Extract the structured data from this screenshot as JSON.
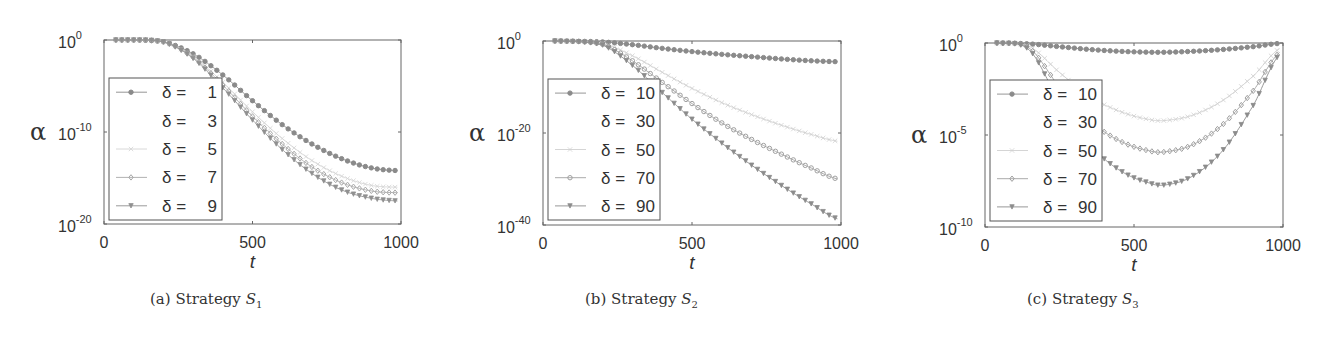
{
  "chart_data": [
    {
      "type": "line",
      "panel_label": "(a)",
      "caption_text": "Strategy",
      "caption_symbol": "S",
      "caption_subscript": "1",
      "xlabel": "t",
      "ylabel": "α",
      "yscale": "log",
      "xlim": [
        0,
        1000
      ],
      "ylim_exponents": [
        -20,
        0
      ],
      "xticks": [
        0,
        500,
        1000
      ],
      "yticks": [
        {
          "base": "10",
          "exp": "0",
          "value": 0
        },
        {
          "base": "10",
          "exp": "-10",
          "value": -10
        },
        {
          "base": "10",
          "exp": "-20",
          "value": -20
        }
      ],
      "legend_position": "center-left",
      "x": [
        40,
        200,
        300,
        400,
        500,
        600,
        700,
        800,
        900,
        990
      ],
      "series": [
        {
          "name": "δ =   1",
          "label_prefix": "δ =",
          "label_value": "1",
          "marker": "dot",
          "color": "#8a8a8a",
          "log10_values": [
            0,
            -0.2,
            -1.5,
            -3.8,
            -6.6,
            -9.2,
            -11.3,
            -12.9,
            -13.9,
            -14.2
          ]
        },
        {
          "name": "δ =   3",
          "label_prefix": "δ =",
          "label_value": "3",
          "marker": "none",
          "color": "#ffffff",
          "log10_values": [
            0,
            -0.2,
            -1.7,
            -4.3,
            -7.4,
            -10.2,
            -12.5,
            -14.2,
            -15.3,
            -15.7
          ]
        },
        {
          "name": "δ =   5",
          "label_prefix": "δ =",
          "label_value": "5",
          "marker": "x",
          "color": "#d4d4d4",
          "log10_values": [
            0,
            -0.2,
            -1.8,
            -4.6,
            -7.8,
            -10.7,
            -13.1,
            -14.8,
            -15.8,
            -16.0
          ]
        },
        {
          "name": "δ =   7",
          "label_prefix": "δ =",
          "label_value": "7",
          "marker": "diamond",
          "color": "#a8a8a8",
          "log10_values": [
            0,
            -0.2,
            -1.9,
            -4.9,
            -8.3,
            -11.3,
            -13.8,
            -15.5,
            -16.4,
            -16.6
          ]
        },
        {
          "name": "δ =   9",
          "label_prefix": "δ =",
          "label_value": "9",
          "marker": "triangle",
          "color": "#909090",
          "log10_values": [
            0,
            -0.2,
            -2.0,
            -5.2,
            -8.7,
            -11.9,
            -14.5,
            -16.3,
            -17.2,
            -17.5
          ]
        }
      ]
    },
    {
      "type": "line",
      "panel_label": "(b)",
      "caption_text": "Strategy",
      "caption_symbol": "S",
      "caption_subscript": "2",
      "xlabel": "t",
      "ylabel": "α",
      "yscale": "log",
      "xlim": [
        0,
        1000
      ],
      "ylim_exponents": [
        -40,
        0
      ],
      "xticks": [
        0,
        500,
        1000
      ],
      "yticks": [
        {
          "base": "10",
          "exp": "0",
          "value": 0
        },
        {
          "base": "10",
          "exp": "-20",
          "value": -20
        },
        {
          "base": "10",
          "exp": "-40",
          "value": -40
        }
      ],
      "legend_position": "center-left",
      "x": [
        40,
        200,
        300,
        400,
        500,
        600,
        700,
        800,
        900,
        990
      ],
      "series": [
        {
          "name": "δ = 10",
          "label_prefix": "δ =",
          "label_value": "10",
          "marker": "dot",
          "color": "#8a8a8a",
          "log10_values": [
            0,
            -0.2,
            -0.8,
            -1.6,
            -2.3,
            -2.9,
            -3.4,
            -3.9,
            -4.3,
            -4.5
          ]
        },
        {
          "name": "δ = 30",
          "label_prefix": "δ =",
          "label_value": "30",
          "marker": "none",
          "color": "#ffffff",
          "log10_values": [
            0,
            -0.3,
            -2.0,
            -4.5,
            -7.0,
            -9.2,
            -11.0,
            -12.5,
            -13.6,
            -14.3
          ]
        },
        {
          "name": "δ = 50",
          "label_prefix": "δ =",
          "label_value": "50",
          "marker": "x",
          "color": "#d0d0d0",
          "log10_values": [
            0,
            -0.5,
            -3.2,
            -6.8,
            -10.3,
            -13.4,
            -16.0,
            -18.3,
            -20.3,
            -21.8
          ]
        },
        {
          "name": "δ = 70",
          "label_prefix": "δ =",
          "label_value": "70",
          "marker": "circle",
          "color": "#a0a0a0",
          "log10_values": [
            0,
            -0.7,
            -4.3,
            -9.0,
            -13.6,
            -17.8,
            -21.4,
            -24.6,
            -27.6,
            -30.0
          ]
        },
        {
          "name": "δ = 90",
          "label_prefix": "δ =",
          "label_value": "90",
          "marker": "triangle",
          "color": "#8c8c8c",
          "log10_values": [
            0,
            -0.9,
            -5.3,
            -11.2,
            -17.0,
            -22.2,
            -27.0,
            -31.4,
            -35.4,
            -38.7
          ]
        }
      ]
    },
    {
      "type": "line",
      "panel_label": "(c)",
      "caption_text": "Strategy",
      "caption_symbol": "S",
      "caption_subscript": "3",
      "xlabel": "t",
      "ylabel": "α",
      "yscale": "log",
      "xlim": [
        0,
        1000
      ],
      "ylim_exponents": [
        -10,
        0
      ],
      "xticks": [
        0,
        500,
        1000
      ],
      "yticks": [
        {
          "base": "10",
          "exp": "0",
          "value": 0
        },
        {
          "base": "10",
          "exp": "-5",
          "value": -5
        },
        {
          "base": "10",
          "exp": "-10",
          "value": -10
        }
      ],
      "legend_position": "center-left",
      "x": [
        40,
        150,
        250,
        350,
        450,
        550,
        610,
        700,
        800,
        900,
        990
      ],
      "series": [
        {
          "name": "δ = 10",
          "label_prefix": "δ =",
          "label_value": "10",
          "marker": "dot",
          "color": "#8a8a8a",
          "log10_values": [
            0,
            -0.05,
            -0.2,
            -0.35,
            -0.45,
            -0.5,
            -0.5,
            -0.45,
            -0.35,
            -0.2,
            -0.02
          ]
        },
        {
          "name": "δ = 30",
          "label_prefix": "δ =",
          "label_value": "30",
          "marker": "none",
          "color": "#ffffff",
          "log10_values": [
            0,
            -0.1,
            -0.9,
            -1.7,
            -2.2,
            -2.5,
            -2.5,
            -2.3,
            -1.8,
            -1.0,
            -0.1
          ]
        },
        {
          "name": "δ = 50",
          "label_prefix": "δ =",
          "label_value": "50",
          "marker": "x",
          "color": "#d0d0d0",
          "log10_values": [
            0,
            -0.2,
            -1.6,
            -2.9,
            -3.7,
            -4.15,
            -4.2,
            -3.9,
            -3.1,
            -1.8,
            -0.3
          ]
        },
        {
          "name": "δ = 70",
          "label_prefix": "δ =",
          "label_value": "70",
          "marker": "diamond",
          "color": "#a0a0a0",
          "log10_values": [
            0,
            -0.3,
            -2.4,
            -4.2,
            -5.3,
            -5.85,
            -5.9,
            -5.5,
            -4.4,
            -2.6,
            -0.5
          ]
        },
        {
          "name": "δ = 90",
          "label_prefix": "δ =",
          "label_value": "90",
          "marker": "triangle",
          "color": "#8c8c8c",
          "log10_values": [
            0,
            -0.4,
            -3.2,
            -5.5,
            -6.9,
            -7.6,
            -7.7,
            -7.2,
            -5.8,
            -3.4,
            -0.6
          ]
        }
      ]
    }
  ],
  "layout": {
    "panels": [
      {
        "offset_x": 0,
        "plot": {
          "x0": 104,
          "y0": 40,
          "x1": 401,
          "y1": 224
        },
        "legend": {
          "x0": 109,
          "y0": 78,
          "x1": 222,
          "y1": 220
        },
        "caption_x": 150
      },
      {
        "offset_x": 440,
        "plot": {
          "x0": 543,
          "y0": 41,
          "x1": 841,
          "y1": 225
        },
        "legend": {
          "x0": 548,
          "y0": 79,
          "x1": 660,
          "y1": 220
        },
        "caption_x": 585
      },
      {
        "offset_x": 880,
        "plot": {
          "x0": 985,
          "y0": 43,
          "x1": 1283,
          "y1": 227
        },
        "legend": {
          "x0": 990,
          "y0": 80,
          "x1": 1102,
          "y1": 221
        },
        "caption_x": 1027
      }
    ]
  }
}
